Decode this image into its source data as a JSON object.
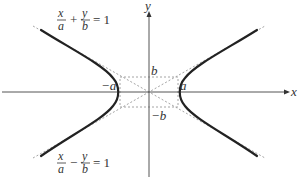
{
  "diagram": {
    "axes": {
      "x_label": "x",
      "y_label": "y"
    },
    "vertex_labels": {
      "neg_a": "−a",
      "pos_a": "a",
      "pos_b": "b",
      "neg_b": "−b"
    },
    "equations": {
      "upper": {
        "term1_num": "x",
        "term1_den": "a",
        "operator": "+",
        "term2_num": "y",
        "term2_den": "b",
        "equals": "= 1"
      },
      "lower": {
        "term1_num": "x",
        "term1_den": "a",
        "operator": "−",
        "term2_num": "y",
        "term2_den": "b",
        "equals": "= 1"
      }
    },
    "colors": {
      "curve": "#222222",
      "axis": "#555555",
      "dashed": "#999999",
      "text": "#333333"
    }
  }
}
